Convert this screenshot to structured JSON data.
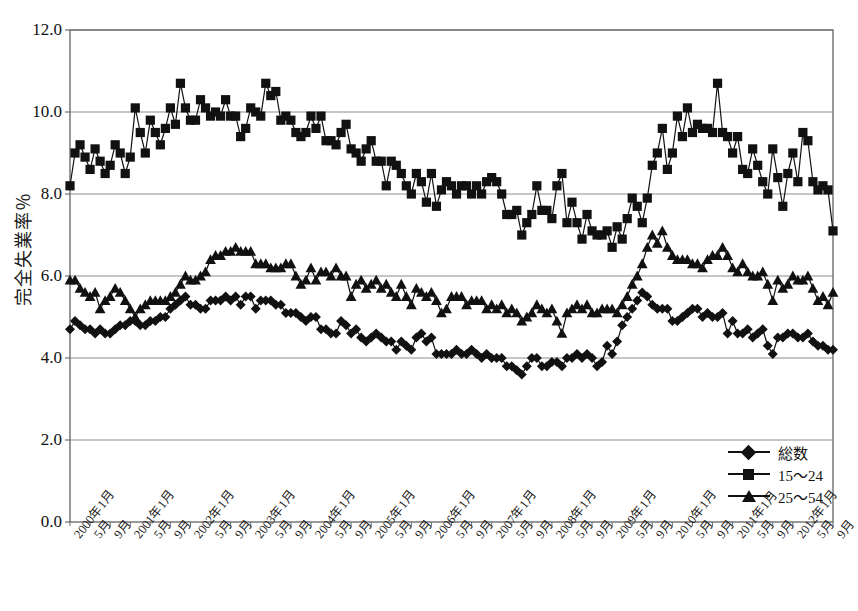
{
  "chart_data": {
    "type": "line",
    "title": "",
    "xlabel": "",
    "ylabel": "完全失業率％",
    "ylim": [
      0.0,
      12.0
    ],
    "ytick_values": [
      0.0,
      2.0,
      4.0,
      6.0,
      8.0,
      10.0,
      12.0
    ],
    "ytick_labels": [
      "0.0",
      "2.0",
      "4.0",
      "6.0",
      "8.0",
      "10.0",
      "12.0"
    ],
    "grid": true,
    "legend_position": "bottom-right inside plot",
    "x_start": "2000年1月",
    "x_end": "2012年9月",
    "x_tick_interval_months": 4,
    "xtick_labels": [
      "2000年1月",
      "5月",
      "9月",
      "2001年1月",
      "5月",
      "9月",
      "2002年1月",
      "5月",
      "9月",
      "2003年1月",
      "5月",
      "9月",
      "2004年1月",
      "5月",
      "9月",
      "2005年1月",
      "5月",
      "9月",
      "2006年1月",
      "5月",
      "9月",
      "2007年1月",
      "5月",
      "9月",
      "2008年1月",
      "5月",
      "9月",
      "2009年1月",
      "5月",
      "9月",
      "2010年1月",
      "5月",
      "9月",
      "2011年1月",
      "5月",
      "9月",
      "2012年1月",
      "5月",
      "9月"
    ],
    "series": [
      {
        "name": "総数",
        "marker": "diamond",
        "color": "#111111",
        "values": [
          4.7,
          4.9,
          4.8,
          4.7,
          4.7,
          4.6,
          4.7,
          4.6,
          4.6,
          4.7,
          4.8,
          4.8,
          4.9,
          4.9,
          4.8,
          4.8,
          4.9,
          4.9,
          5.0,
          5.0,
          5.2,
          5.3,
          5.4,
          5.5,
          5.3,
          5.3,
          5.2,
          5.2,
          5.4,
          5.4,
          5.4,
          5.5,
          5.4,
          5.5,
          5.3,
          5.5,
          5.5,
          5.2,
          5.4,
          5.4,
          5.4,
          5.3,
          5.3,
          5.1,
          5.1,
          5.1,
          5.0,
          4.9,
          5.0,
          5.0,
          4.7,
          4.7,
          4.6,
          4.6,
          4.9,
          4.8,
          4.6,
          4.7,
          4.5,
          4.4,
          4.5,
          4.6,
          4.5,
          4.4,
          4.4,
          4.2,
          4.4,
          4.3,
          4.2,
          4.5,
          4.6,
          4.4,
          4.5,
          4.1,
          4.1,
          4.1,
          4.1,
          4.2,
          4.1,
          4.1,
          4.2,
          4.1,
          4.0,
          4.1,
          4.0,
          4.0,
          4.0,
          3.8,
          3.8,
          3.7,
          3.6,
          3.8,
          4.0,
          4.0,
          3.8,
          3.8,
          3.9,
          3.9,
          3.8,
          4.0,
          4.0,
          4.1,
          4.0,
          4.1,
          4.0,
          3.8,
          3.9,
          4.3,
          4.1,
          4.4,
          4.8,
          5.0,
          5.2,
          5.4,
          5.6,
          5.5,
          5.3,
          5.2,
          5.2,
          5.2,
          4.9,
          4.9,
          5.0,
          5.1,
          5.2,
          5.2,
          5.0,
          5.1,
          5.0,
          5.0,
          5.1,
          4.6,
          4.9,
          4.6,
          4.6,
          4.7,
          4.5,
          4.6,
          4.7,
          4.3,
          4.1,
          4.5,
          4.5,
          4.6,
          4.6,
          4.5,
          4.5,
          4.6,
          4.4,
          4.3,
          4.3,
          4.2,
          4.2
        ]
      },
      {
        "name": "15～24",
        "marker": "square",
        "color": "#111111",
        "values": [
          8.2,
          9.0,
          9.2,
          8.9,
          8.6,
          9.1,
          8.8,
          8.5,
          8.7,
          9.2,
          9.0,
          8.5,
          8.9,
          10.1,
          9.5,
          9.0,
          9.8,
          9.5,
          9.2,
          9.6,
          10.1,
          9.7,
          10.7,
          10.1,
          9.8,
          9.8,
          10.3,
          10.1,
          9.9,
          10.0,
          9.9,
          10.3,
          9.9,
          9.9,
          9.4,
          9.6,
          10.1,
          10.0,
          9.9,
          10.7,
          10.4,
          10.5,
          9.8,
          9.9,
          9.8,
          9.5,
          9.4,
          9.5,
          9.9,
          9.6,
          9.9,
          9.3,
          9.3,
          9.2,
          9.5,
          9.7,
          9.1,
          9.0,
          8.8,
          9.1,
          9.3,
          8.8,
          8.8,
          8.2,
          8.8,
          8.7,
          8.5,
          8.2,
          8.0,
          8.5,
          8.3,
          7.8,
          8.5,
          7.7,
          8.1,
          8.3,
          8.2,
          8.0,
          8.2,
          8.2,
          8.0,
          8.2,
          8.0,
          8.3,
          8.4,
          8.3,
          8.0,
          7.5,
          7.5,
          7.6,
          7.0,
          7.3,
          7.5,
          8.2,
          7.6,
          7.6,
          7.4,
          8.2,
          8.5,
          7.3,
          7.8,
          7.3,
          6.9,
          7.5,
          7.1,
          7.0,
          7.0,
          7.1,
          6.7,
          7.2,
          6.9,
          7.4,
          7.9,
          7.7,
          7.3,
          7.9,
          8.7,
          9.0,
          9.6,
          8.6,
          9.0,
          9.9,
          9.4,
          10.1,
          9.5,
          9.7,
          9.6,
          9.6,
          9.5,
          10.7,
          9.5,
          9.4,
          9.0,
          9.4,
          8.6,
          8.5,
          9.1,
          8.7,
          8.3,
          8.0,
          9.1,
          8.4,
          7.7,
          8.5,
          9.0,
          8.3,
          9.5,
          9.3,
          8.3,
          8.1,
          8.2,
          8.1,
          7.1
        ]
      },
      {
        "name": "25～54",
        "marker": "triangle",
        "color": "#111111",
        "values": [
          5.9,
          5.9,
          5.7,
          5.6,
          5.5,
          5.6,
          5.2,
          5.4,
          5.5,
          5.7,
          5.6,
          5.4,
          5.2,
          5.0,
          5.2,
          5.3,
          5.4,
          5.4,
          5.4,
          5.4,
          5.5,
          5.6,
          5.8,
          6.0,
          5.9,
          5.9,
          6.0,
          6.1,
          6.4,
          6.5,
          6.5,
          6.6,
          6.6,
          6.7,
          6.6,
          6.6,
          6.6,
          6.3,
          6.3,
          6.3,
          6.2,
          6.2,
          6.2,
          6.3,
          6.3,
          6.0,
          5.8,
          5.9,
          6.2,
          5.9,
          6.1,
          6.1,
          6.0,
          6.2,
          6.0,
          6.0,
          5.5,
          5.8,
          5.9,
          5.7,
          5.8,
          5.9,
          5.7,
          5.8,
          5.6,
          5.5,
          5.8,
          5.5,
          5.3,
          5.7,
          5.6,
          5.5,
          5.6,
          5.4,
          5.1,
          5.2,
          5.5,
          5.5,
          5.5,
          5.3,
          5.4,
          5.4,
          5.4,
          5.2,
          5.3,
          5.2,
          5.3,
          5.1,
          5.2,
          5.1,
          4.9,
          5.0,
          5.1,
          5.3,
          5.2,
          5.1,
          5.2,
          4.9,
          4.6,
          5.1,
          5.2,
          5.3,
          5.2,
          5.3,
          5.1,
          5.1,
          5.2,
          5.2,
          5.2,
          5.1,
          5.3,
          5.5,
          5.8,
          6.0,
          6.3,
          6.7,
          7.0,
          6.8,
          7.1,
          6.7,
          6.5,
          6.4,
          6.4,
          6.4,
          6.3,
          6.3,
          6.2,
          6.4,
          6.5,
          6.5,
          6.7,
          6.5,
          6.2,
          6.1,
          6.3,
          6.1,
          6.0,
          6.0,
          6.1,
          5.8,
          5.4,
          5.9,
          5.7,
          5.8,
          6.0,
          5.9,
          5.9,
          6.0,
          5.7,
          5.4,
          5.5,
          5.3,
          5.6
        ]
      }
    ]
  },
  "legend": {
    "entries": [
      {
        "label": "総数"
      },
      {
        "label": "15～24"
      },
      {
        "label": "25～54"
      }
    ]
  }
}
